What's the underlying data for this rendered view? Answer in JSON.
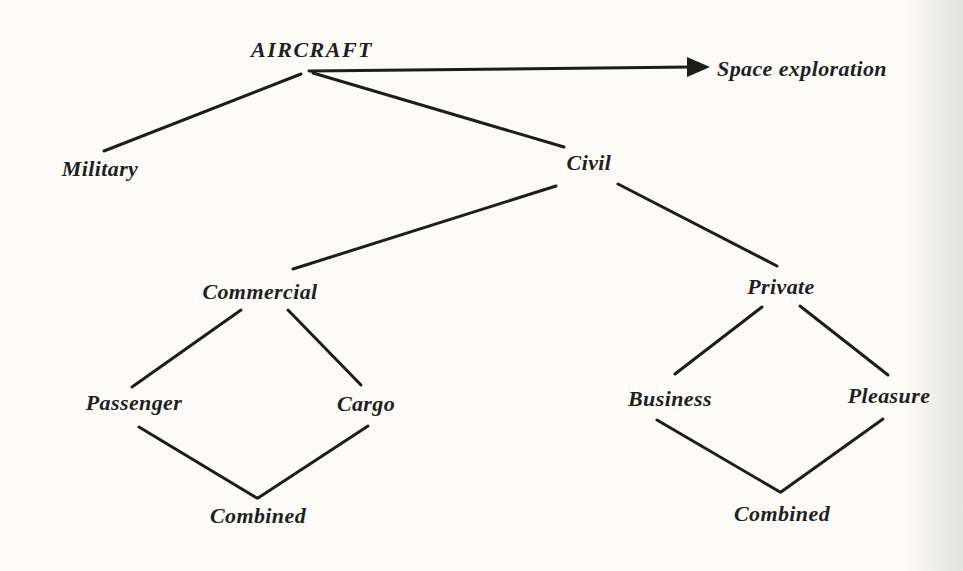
{
  "diagram": {
    "type": "tree",
    "root": "AIRCRAFT",
    "colors": {
      "ink": "#1d1d1d",
      "paper": "#fcfbf7"
    },
    "nodes": {
      "aircraft": {
        "label": "AIRCRAFT"
      },
      "space_exploration": {
        "label": "Space exploration"
      },
      "military": {
        "label": "Military"
      },
      "civil": {
        "label": "Civil"
      },
      "commercial": {
        "label": "Commercial"
      },
      "private": {
        "label": "Private"
      },
      "passenger": {
        "label": "Passenger"
      },
      "cargo": {
        "label": "Cargo"
      },
      "business": {
        "label": "Business"
      },
      "pleasure": {
        "label": "Pleasure"
      },
      "combined_commercial": {
        "label": "Combined"
      },
      "combined_private": {
        "label": "Combined"
      }
    },
    "edges": [
      {
        "from": "aircraft",
        "to": "military",
        "style": "line"
      },
      {
        "from": "aircraft",
        "to": "civil",
        "style": "line"
      },
      {
        "from": "aircraft",
        "to": "space_exploration",
        "style": "arrow"
      },
      {
        "from": "civil",
        "to": "commercial",
        "style": "line"
      },
      {
        "from": "civil",
        "to": "private",
        "style": "line"
      },
      {
        "from": "commercial",
        "to": "passenger",
        "style": "line"
      },
      {
        "from": "commercial",
        "to": "cargo",
        "style": "line"
      },
      {
        "from": "passenger",
        "to": "combined_commercial",
        "style": "line"
      },
      {
        "from": "cargo",
        "to": "combined_commercial",
        "style": "line"
      },
      {
        "from": "private",
        "to": "business",
        "style": "line"
      },
      {
        "from": "private",
        "to": "pleasure",
        "style": "line"
      },
      {
        "from": "business",
        "to": "combined_private",
        "style": "line"
      },
      {
        "from": "pleasure",
        "to": "combined_private",
        "style": "line"
      }
    ]
  }
}
